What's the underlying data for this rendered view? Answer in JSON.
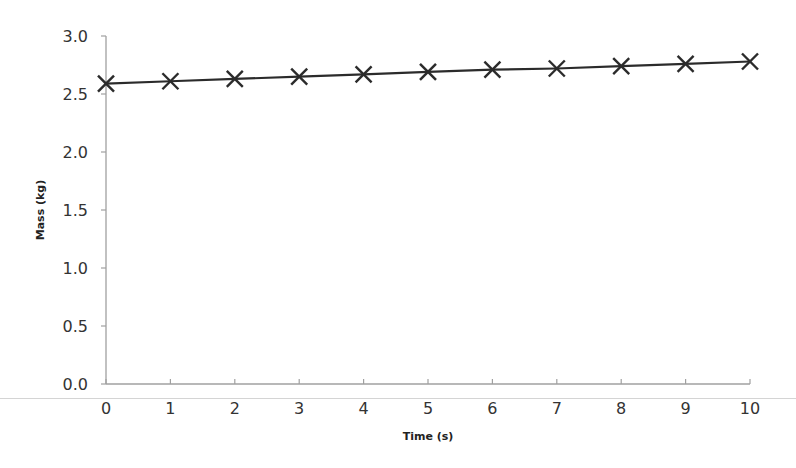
{
  "chart_data": {
    "type": "line",
    "title": "",
    "xlabel": "Time (s)",
    "ylabel": "Mass (kg)",
    "x": [
      0,
      1,
      2,
      3,
      4,
      5,
      6,
      7,
      8,
      9,
      10
    ],
    "series": [
      {
        "name": "Mass",
        "marker": "x",
        "values": [
          2.59,
          2.61,
          2.63,
          2.65,
          2.67,
          2.69,
          2.71,
          2.72,
          2.74,
          2.76,
          2.78
        ]
      }
    ],
    "xlim": [
      0,
      10
    ],
    "ylim": [
      0,
      3.0
    ],
    "xticks": [
      "0",
      "1",
      "2",
      "3",
      "4",
      "5",
      "6",
      "7",
      "8",
      "9",
      "10"
    ],
    "yticks": [
      "0.0",
      "0.5",
      "1.0",
      "1.5",
      "2.0",
      "2.5",
      "3.0"
    ],
    "grid": false,
    "legend": "none",
    "colors": {
      "line": "#2b2b2b",
      "axis": "#a0a0a0",
      "text": "#333333"
    }
  }
}
